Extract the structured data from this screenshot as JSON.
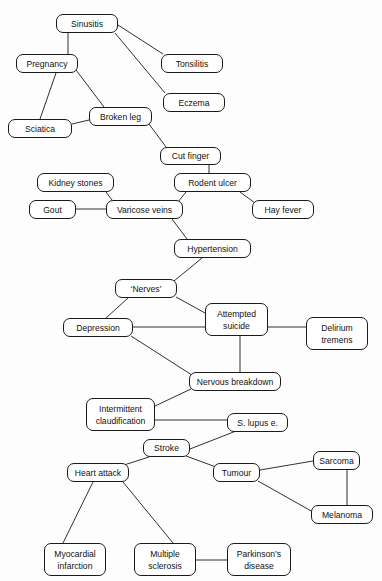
{
  "diagram": {
    "type": "undirected-graph",
    "nodes": [
      {
        "id": "sinusitis",
        "label": "Sinusitis",
        "x": 56,
        "y": 14,
        "w": 62,
        "h": 19
      },
      {
        "id": "pregnancy",
        "label": "Pregnancy",
        "x": 16,
        "y": 54,
        "w": 62,
        "h": 19
      },
      {
        "id": "tonsilitis",
        "label": "Tonsilitis",
        "x": 161,
        "y": 54,
        "w": 62,
        "h": 19
      },
      {
        "id": "eczema",
        "label": "Eczema",
        "x": 163,
        "y": 93,
        "w": 62,
        "h": 19
      },
      {
        "id": "broken-leg",
        "label": "Broken leg",
        "x": 89,
        "y": 107,
        "w": 63,
        "h": 19
      },
      {
        "id": "sciatica",
        "label": "Sciatica",
        "x": 8,
        "y": 119,
        "w": 64,
        "h": 19
      },
      {
        "id": "cut-finger",
        "label": "Cut finger",
        "x": 160,
        "y": 147,
        "w": 61,
        "h": 18
      },
      {
        "id": "kidney-stones",
        "label": "Kidney stones",
        "x": 37,
        "y": 173,
        "w": 77,
        "h": 19
      },
      {
        "id": "rodent-ulcer",
        "label": "Rodent ulcer",
        "x": 174,
        "y": 173,
        "w": 77,
        "h": 19
      },
      {
        "id": "gout",
        "label": "Gout",
        "x": 29,
        "y": 200,
        "w": 47,
        "h": 19
      },
      {
        "id": "varicose-veins",
        "label": "Varicose veins",
        "x": 106,
        "y": 200,
        "w": 77,
        "h": 19
      },
      {
        "id": "hay-fever",
        "label": "Hay fever",
        "x": 252,
        "y": 200,
        "w": 62,
        "h": 19
      },
      {
        "id": "hypertension",
        "label": "Hypertension",
        "x": 174,
        "y": 239,
        "w": 77,
        "h": 19
      },
      {
        "id": "nerves",
        "label": "‘Nerves’",
        "x": 115,
        "y": 279,
        "w": 62,
        "h": 19
      },
      {
        "id": "attempted-suicide",
        "label": "Attempted\nsuicide",
        "x": 205,
        "y": 303,
        "w": 63,
        "h": 33
      },
      {
        "id": "depression",
        "label": "Depression",
        "x": 63,
        "y": 318,
        "w": 70,
        "h": 19
      },
      {
        "id": "delirium-tremens",
        "label": "Delirium\ntremens",
        "x": 306,
        "y": 317,
        "w": 62,
        "h": 33
      },
      {
        "id": "nervous-breakdown",
        "label": "Nervous breakdown",
        "x": 189,
        "y": 372,
        "w": 92,
        "h": 19
      },
      {
        "id": "intermittent-claudification",
        "label": "Intermittent\nclaudification",
        "x": 86,
        "y": 398,
        "w": 69,
        "h": 33
      },
      {
        "id": "s-lupus-e",
        "label": "S. lupus e.",
        "x": 227,
        "y": 413,
        "w": 61,
        "h": 19
      },
      {
        "id": "stroke",
        "label": "Stroke",
        "x": 143,
        "y": 439,
        "w": 47,
        "h": 18
      },
      {
        "id": "sarcoma",
        "label": "Sarcoma",
        "x": 313,
        "y": 451,
        "w": 47,
        "h": 19
      },
      {
        "id": "heart-attack",
        "label": "Heart attack",
        "x": 67,
        "y": 463,
        "w": 62,
        "h": 19
      },
      {
        "id": "tumour",
        "label": "Tumour",
        "x": 213,
        "y": 463,
        "w": 47,
        "h": 19
      },
      {
        "id": "melanoma",
        "label": "Melanoma",
        "x": 311,
        "y": 505,
        "w": 62,
        "h": 19
      },
      {
        "id": "myocardial-infarction",
        "label": "Myocardial\ninfarction",
        "x": 44,
        "y": 543,
        "w": 62,
        "h": 33
      },
      {
        "id": "multiple-sclerosis",
        "label": "Multiple\nsclerosis",
        "x": 134,
        "y": 543,
        "w": 62,
        "h": 33
      },
      {
        "id": "parkinsons-disease",
        "label": "Parkinson’s\ndisease",
        "x": 227,
        "y": 543,
        "w": 64,
        "h": 33
      }
    ],
    "edges": [
      {
        "from": "sinusitis",
        "to": "pregnancy",
        "x1": 68,
        "y1": 33,
        "x2": 68,
        "y2": 54
      },
      {
        "from": "sinusitis",
        "to": "tonsilitis",
        "x1": 118,
        "y1": 25,
        "x2": 163,
        "y2": 54
      },
      {
        "from": "sinusitis",
        "to": "eczema",
        "x1": 115,
        "y1": 33,
        "x2": 165,
        "y2": 93
      },
      {
        "from": "pregnancy",
        "to": "sciatica",
        "x1": 56,
        "y1": 73,
        "x2": 40,
        "y2": 119
      },
      {
        "from": "pregnancy",
        "to": "broken-leg",
        "x1": 76,
        "y1": 70,
        "x2": 104,
        "y2": 107
      },
      {
        "from": "sciatica",
        "to": "broken-leg",
        "x1": 72,
        "y1": 124,
        "x2": 89,
        "y2": 120
      },
      {
        "from": "broken-leg",
        "to": "cut-finger",
        "x1": 149,
        "y1": 124,
        "x2": 166,
        "y2": 147
      },
      {
        "from": "cut-finger",
        "to": "rodent-ulcer",
        "x1": 209,
        "y1": 165,
        "x2": 209,
        "y2": 173
      },
      {
        "from": "rodent-ulcer",
        "to": "varicose-veins",
        "x1": 186,
        "y1": 192,
        "x2": 178,
        "y2": 202
      },
      {
        "from": "rodent-ulcer",
        "to": "hay-fever",
        "x1": 240,
        "y1": 192,
        "x2": 255,
        "y2": 203
      },
      {
        "from": "kidney-stones",
        "to": "varicose-veins",
        "x1": 106,
        "y1": 192,
        "x2": 112,
        "y2": 200
      },
      {
        "from": "gout",
        "to": "varicose-veins",
        "x1": 76,
        "y1": 209,
        "x2": 106,
        "y2": 209
      },
      {
        "from": "varicose-veins",
        "to": "hypertension",
        "x1": 172,
        "y1": 219,
        "x2": 187,
        "y2": 239
      },
      {
        "from": "hypertension",
        "to": "nerves",
        "x1": 202,
        "y1": 258,
        "x2": 174,
        "y2": 281
      },
      {
        "from": "nerves",
        "to": "depression",
        "x1": 128,
        "y1": 298,
        "x2": 106,
        "y2": 318
      },
      {
        "from": "nerves",
        "to": "attempted-suicide",
        "x1": 176,
        "y1": 297,
        "x2": 205,
        "y2": 313
      },
      {
        "from": "depression",
        "to": "attempted-suicide",
        "x1": 133,
        "y1": 327,
        "x2": 205,
        "y2": 327
      },
      {
        "from": "attempted-suicide",
        "to": "delirium-tremens",
        "x1": 268,
        "y1": 327,
        "x2": 306,
        "y2": 327
      },
      {
        "from": "attempted-suicide",
        "to": "nervous-breakdown",
        "x1": 240,
        "y1": 336,
        "x2": 240,
        "y2": 372
      },
      {
        "from": "depression",
        "to": "nervous-breakdown",
        "x1": 131,
        "y1": 336,
        "x2": 195,
        "y2": 377
      },
      {
        "from": "nervous-breakdown",
        "to": "intermittent-claudification",
        "x1": 191,
        "y1": 389,
        "x2": 155,
        "y2": 406
      },
      {
        "from": "intermittent-claudification",
        "to": "s-lupus-e",
        "x1": 155,
        "y1": 420,
        "x2": 227,
        "y2": 420
      },
      {
        "from": "s-lupus-e",
        "to": "stroke",
        "x1": 236,
        "y1": 431,
        "x2": 190,
        "y2": 449
      },
      {
        "from": "stroke",
        "to": "heart-attack",
        "x1": 149,
        "y1": 457,
        "x2": 124,
        "y2": 465
      },
      {
        "from": "stroke",
        "to": "tumour",
        "x1": 186,
        "y1": 456,
        "x2": 216,
        "y2": 467
      },
      {
        "from": "tumour",
        "to": "sarcoma",
        "x1": 260,
        "y1": 470,
        "x2": 313,
        "y2": 461
      },
      {
        "from": "tumour",
        "to": "melanoma",
        "x1": 258,
        "y1": 481,
        "x2": 313,
        "y2": 512
      },
      {
        "from": "sarcoma",
        "to": "melanoma",
        "x1": 347,
        "y1": 470,
        "x2": 347,
        "y2": 505
      },
      {
        "from": "heart-attack",
        "to": "myocardial-infarction",
        "x1": 93,
        "y1": 482,
        "x2": 63,
        "y2": 543
      },
      {
        "from": "heart-attack",
        "to": "multiple-sclerosis",
        "x1": 123,
        "y1": 482,
        "x2": 173,
        "y2": 543
      },
      {
        "from": "multiple-sclerosis",
        "to": "parkinsons-disease",
        "x1": 196,
        "y1": 560,
        "x2": 227,
        "y2": 560
      }
    ]
  }
}
